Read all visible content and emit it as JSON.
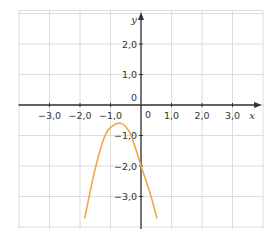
{
  "chart_data": {
    "type": "line",
    "title": "",
    "xlabel": "x",
    "ylabel": "y",
    "xlim": [
      -4.0,
      4.0
    ],
    "ylim": [
      -4.0,
      3.0
    ],
    "grid": true,
    "x_ticks": [
      -3.0,
      -2.0,
      -1.0,
      1.0,
      2.0,
      3.0
    ],
    "x_tick_labels": [
      "−3,0",
      "−2,0",
      "−1,0",
      "1,0",
      "2,0",
      "3,0"
    ],
    "y_ticks": [
      2.0,
      1.0,
      -1.0,
      -2.0,
      -3.0
    ],
    "y_tick_labels": [
      "2,0",
      "1,0",
      "−1,0",
      "−2,0",
      "−3,0"
    ],
    "origin_labels": [
      "0",
      "0"
    ],
    "series": [
      {
        "name": "curve",
        "color": "#f2a648",
        "description": "downward-opening parabola, vertex near (-0.67, -0.6), y-intercept -2.0",
        "x": [
          -1.84,
          -1.7,
          -1.48,
          -1.18,
          -0.95,
          -0.67,
          -0.4,
          -0.2,
          0.0,
          0.17,
          0.33,
          0.52
        ],
        "y": [
          -3.7,
          -3.0,
          -2.0,
          -1.0,
          -0.7,
          -0.6,
          -0.85,
          -1.35,
          -2.0,
          -2.5,
          -3.0,
          -3.7
        ]
      }
    ]
  },
  "colors": {
    "grid": "#dcdcdc",
    "axis": "#333333",
    "curve": "#f2a648"
  }
}
